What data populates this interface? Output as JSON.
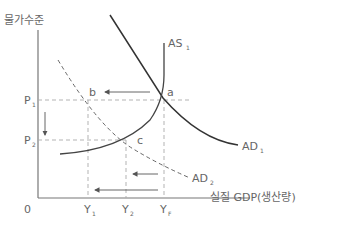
{
  "axes": {
    "y_label": "물가수준",
    "x_label": "실질 GDP(생산량)",
    "origin": "0"
  },
  "price_levels": [
    {
      "main": "P",
      "sub": "1"
    },
    {
      "main": "P",
      "sub": "2"
    }
  ],
  "outputs": [
    {
      "main": "Y",
      "sub": "1"
    },
    {
      "main": "Y",
      "sub": "2"
    },
    {
      "main": "Y",
      "sub": "F"
    }
  ],
  "curves": {
    "as1": {
      "main": "AS",
      "sub": "1"
    },
    "ad1": {
      "main": "AD",
      "sub": "1"
    },
    "ad2": {
      "main": "AD",
      "sub": "2"
    }
  },
  "points": {
    "a": "a",
    "b": "b",
    "c": "c"
  },
  "colors": {
    "curve_dark": "#333333",
    "curve_gray": "#555555",
    "dashed": "#aaaaaa",
    "axis": "#777777",
    "text": "#666666"
  }
}
